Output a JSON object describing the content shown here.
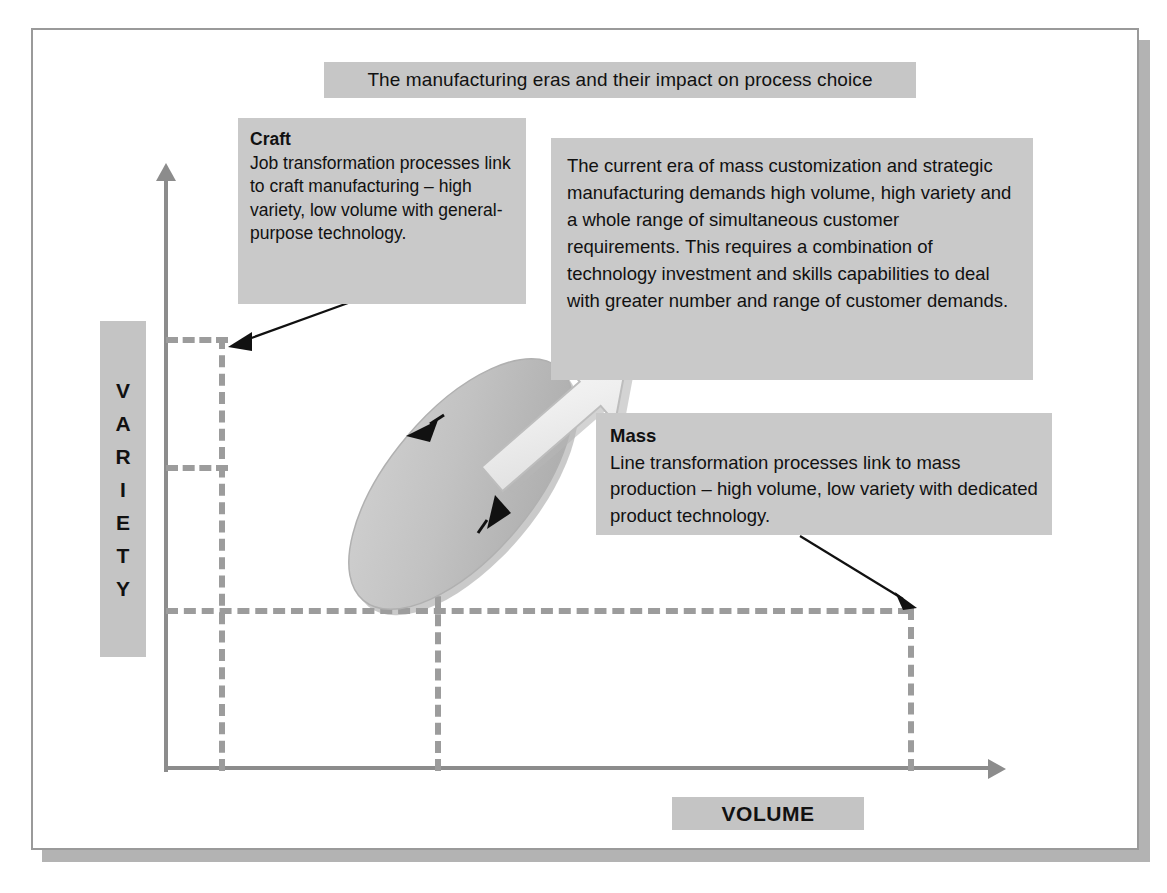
{
  "diagram": {
    "title": "The manufacturing eras and their impact on  process choice",
    "axes": {
      "y_label_letters": [
        "V",
        "A",
        "R",
        "I",
        "E",
        "T",
        "Y"
      ],
      "y_label": "VARIETY",
      "x_label": "VOLUME"
    },
    "callouts": {
      "craft": {
        "heading": "Craft",
        "body": "Job transformation processes link to craft manufacturing – high variety, low volume with general-purpose technology."
      },
      "era": {
        "heading": "",
        "body": "The current era of mass customization and strategic manufacturing demands high volume, high variety and a whole range of simultaneous customer requirements. This requires a combination of technology investment and skills capabilities to deal with greater number and range of customer demands."
      },
      "mass": {
        "heading": "Mass",
        "body": "Line transformation processes link to mass production – high volume, low variety with dedicated product technology."
      }
    },
    "shapes": {
      "ellipse_name": "process-choice-ellipse",
      "block_arrow_name": "mass-customization-direction-arrow",
      "ellipse_arrow_up_name": "ellipse-arrowhead-upper",
      "ellipse_arrow_down_name": "ellipse-arrowhead-lower"
    },
    "colors": {
      "panel_fill": "#c9c9c9",
      "title_fill": "#c6c6c6",
      "axis_gray": "#8c8c8c",
      "dash_gray": "#9c9c9c",
      "ellipse_fill": "#c0c0c0",
      "block_arrow_fill": "#e8e8e8",
      "frame_border": "#9a9a9a",
      "text": "#111111"
    }
  }
}
